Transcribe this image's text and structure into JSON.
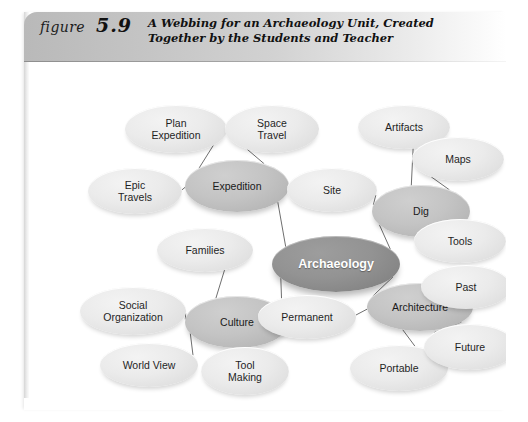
{
  "figure": {
    "label": "figure",
    "number": "5.9",
    "caption_line1": "A Webbing for an Archaeology Unit, Created",
    "caption_line2": "Together by the Students and Teacher"
  },
  "colors": {
    "header_band": "#c3c3c3",
    "center_node": "#8c8c8c",
    "branch_node": "#bdbdbd",
    "leaf_node": "#e7e7e7",
    "connector": "#6f6f6f",
    "page": "#ffffff"
  },
  "diagram": {
    "type": "concept-web",
    "center": {
      "id": "archaeology",
      "label": "Archaeology",
      "kind": "center",
      "x": 243,
      "y": 174,
      "w": 128,
      "h": 56
    },
    "nodes": [
      {
        "id": "expedition",
        "label": "Expedition",
        "kind": "branch",
        "x": 156,
        "y": 98,
        "w": 104,
        "h": 52
      },
      {
        "id": "dig",
        "label": "Dig",
        "kind": "branch",
        "x": 343,
        "y": 123,
        "w": 98,
        "h": 52
      },
      {
        "id": "culture",
        "label": "Culture",
        "kind": "branch",
        "x": 156,
        "y": 234,
        "w": 104,
        "h": 52
      },
      {
        "id": "architecture",
        "label": "Architecture",
        "kind": "branch",
        "x": 338,
        "y": 221,
        "w": 106,
        "h": 48
      },
      {
        "id": "plan-expedition",
        "label": "Plan\nExpedition",
        "kind": "leaf",
        "x": 96,
        "y": 43,
        "w": 102,
        "h": 48
      },
      {
        "id": "space-travel",
        "label": "Space\nTravel",
        "kind": "leaf",
        "x": 196,
        "y": 43,
        "w": 94,
        "h": 48
      },
      {
        "id": "epic-travels",
        "label": "Epic\nTravels",
        "kind": "leaf",
        "x": 59,
        "y": 106,
        "w": 94,
        "h": 46
      },
      {
        "id": "site",
        "label": "Site",
        "kind": "leaf",
        "x": 258,
        "y": 106,
        "w": 90,
        "h": 44
      },
      {
        "id": "artifacts",
        "label": "Artifacts",
        "kind": "leaf",
        "x": 329,
        "y": 43,
        "w": 92,
        "h": 44
      },
      {
        "id": "maps",
        "label": "Maps",
        "kind": "leaf",
        "x": 383,
        "y": 75,
        "w": 92,
        "h": 44
      },
      {
        "id": "tools",
        "label": "Tools",
        "kind": "leaf",
        "x": 385,
        "y": 157,
        "w": 92,
        "h": 44
      },
      {
        "id": "families",
        "label": "Families",
        "kind": "leaf",
        "x": 128,
        "y": 166,
        "w": 96,
        "h": 44
      },
      {
        "id": "social-organization",
        "label": "Social\nOrganization",
        "kind": "leaf",
        "x": 51,
        "y": 225,
        "w": 106,
        "h": 48
      },
      {
        "id": "world-view",
        "label": "World View",
        "kind": "leaf",
        "x": 71,
        "y": 281,
        "w": 98,
        "h": 44
      },
      {
        "id": "tool-making",
        "label": "Tool\nMaking",
        "kind": "leaf",
        "x": 172,
        "y": 285,
        "w": 88,
        "h": 48
      },
      {
        "id": "permanent",
        "label": "Permanent",
        "kind": "leaf",
        "x": 229,
        "y": 233,
        "w": 98,
        "h": 44
      },
      {
        "id": "portable",
        "label": "Portable",
        "kind": "leaf",
        "x": 321,
        "y": 283,
        "w": 98,
        "h": 46
      },
      {
        "id": "past",
        "label": "Past",
        "kind": "leaf",
        "x": 392,
        "y": 203,
        "w": 90,
        "h": 44
      },
      {
        "id": "future",
        "label": "Future",
        "kind": "leaf",
        "x": 395,
        "y": 262,
        "w": 92,
        "h": 46
      }
    ],
    "edges": [
      {
        "from": "archaeology",
        "to": "expedition"
      },
      {
        "from": "archaeology",
        "to": "dig"
      },
      {
        "from": "archaeology",
        "to": "culture"
      },
      {
        "from": "archaeology",
        "to": "architecture"
      },
      {
        "from": "expedition",
        "to": "plan-expedition"
      },
      {
        "from": "expedition",
        "to": "space-travel"
      },
      {
        "from": "expedition",
        "to": "epic-travels"
      },
      {
        "from": "dig",
        "to": "artifacts"
      },
      {
        "from": "dig",
        "to": "maps"
      },
      {
        "from": "dig",
        "to": "tools"
      },
      {
        "from": "dig",
        "to": "site"
      },
      {
        "from": "culture",
        "to": "families"
      },
      {
        "from": "culture",
        "to": "social-organization"
      },
      {
        "from": "culture",
        "to": "world-view"
      },
      {
        "from": "culture",
        "to": "tool-making"
      },
      {
        "from": "architecture",
        "to": "permanent"
      },
      {
        "from": "architecture",
        "to": "portable"
      },
      {
        "from": "architecture",
        "to": "past"
      },
      {
        "from": "architecture",
        "to": "future"
      }
    ]
  }
}
